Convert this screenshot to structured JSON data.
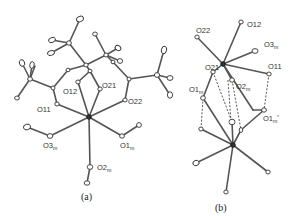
{
  "figure": {
    "panels": [
      {
        "id": "a",
        "caption": "(a)",
        "labels": {
          "O11": {
            "base": "O11",
            "sub": ""
          },
          "O12": {
            "base": "O12",
            "sub": ""
          },
          "O21": {
            "base": "O21",
            "sub": ""
          },
          "O22": {
            "base": "O22",
            "sub": ""
          },
          "O3m": {
            "base": "O3",
            "sub": "m"
          },
          "O1m": {
            "base": "O1",
            "sub": "m"
          },
          "O2m": {
            "base": "O2",
            "sub": "m"
          }
        }
      },
      {
        "id": "b",
        "caption": "(b)",
        "labels": {
          "O12": {
            "base": "O12",
            "sub": ""
          },
          "O22": {
            "base": "O22",
            "sub": ""
          },
          "O3m": {
            "base": "O3",
            "sub": "m"
          },
          "O21": {
            "base": "O21",
            "sub": ""
          },
          "O11": {
            "base": "O11",
            "sub": ""
          },
          "O1m": {
            "base": "O1",
            "sub": "m"
          },
          "O2m": {
            "base": "O2",
            "sub": "m"
          },
          "O1mp": {
            "base": "O1",
            "sub": "m",
            "prime": "′"
          }
        }
      }
    ]
  }
}
